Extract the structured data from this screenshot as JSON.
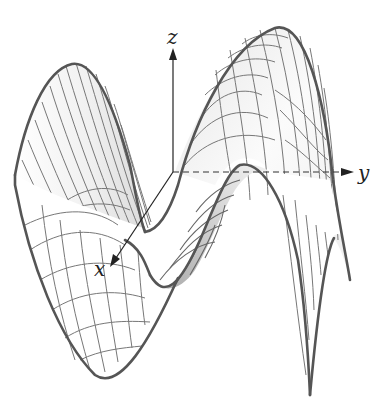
{
  "figure": {
    "type": "3d-surface-wireframe",
    "surface": "saddle",
    "axes": {
      "x": {
        "label": "x"
      },
      "y": {
        "label": "y"
      },
      "z": {
        "label": "z"
      }
    },
    "colors": {
      "outline": "#555555",
      "mesh": "#777777",
      "shade_dark": "#a9a9a9",
      "shade_light": "#f2f2f2",
      "axis": "#222222",
      "background": "#ffffff"
    }
  }
}
